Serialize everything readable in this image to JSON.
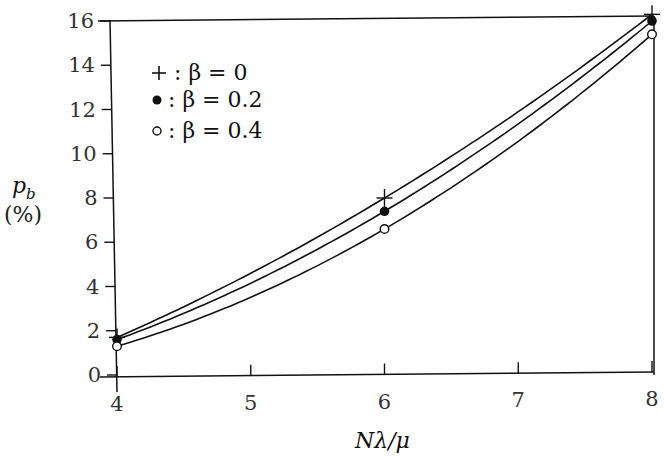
{
  "chart_data": {
    "type": "line",
    "title": "",
    "xlabel": "Nλ/μ",
    "ylabel": "p_b (%)",
    "ylabel_symbol": "p",
    "ylabel_subscript": "b",
    "ylabel_unit": "(%)",
    "xlim": [
      4,
      8
    ],
    "ylim": [
      0,
      16
    ],
    "xticks": [
      "4",
      "5",
      "6",
      "7",
      "8"
    ],
    "yticks": [
      "0",
      "2",
      "4",
      "6",
      "8",
      "10",
      "12",
      "14",
      "16"
    ],
    "grid": false,
    "legend_position": "upper-left",
    "x": [
      4,
      6,
      8
    ],
    "series": [
      {
        "name": "β = 0",
        "marker": "plus",
        "legend_label": "+ : β = 0",
        "values": [
          1.7,
          8.0,
          16.3
        ]
      },
      {
        "name": "β = 0.2",
        "marker": "filled-circle",
        "legend_label": "● : β = 0.2",
        "values": [
          1.6,
          7.4,
          16.0
        ]
      },
      {
        "name": "β = 0.4",
        "marker": "open-circle",
        "legend_label": "○ : β = 0.4",
        "values": [
          1.3,
          6.6,
          15.4
        ]
      }
    ]
  },
  "legend": {
    "items": [
      {
        "symbol": "+",
        "text": ": β = 0"
      },
      {
        "symbol": "●",
        "text": ": β = 0.2"
      },
      {
        "symbol": "○",
        "text": ": β = 0.4"
      }
    ]
  },
  "colors": {
    "ink": "#111111",
    "background": "#ffffff"
  }
}
